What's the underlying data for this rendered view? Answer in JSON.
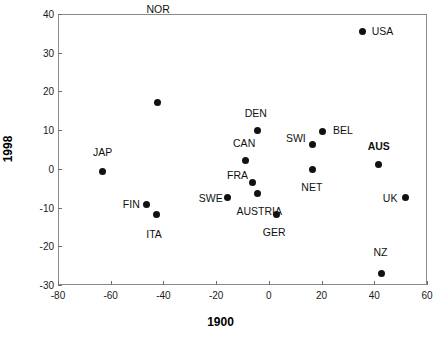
{
  "chart_data": {
    "type": "scatter",
    "title": "",
    "xlabel": "1900",
    "ylabel": "1998",
    "xlim": [
      -80,
      60
    ],
    "ylim": [
      -30,
      40
    ],
    "xticks": [
      -80,
      -60,
      -40,
      -20,
      0,
      20,
      40,
      60
    ],
    "yticks": [
      -30,
      -20,
      -10,
      0,
      10,
      20,
      30,
      40
    ],
    "xtick_labels": [
      "-80",
      "-60",
      "-40",
      "-20",
      "0",
      "20",
      "40",
      "60"
    ],
    "ytick_labels": [
      "-30",
      "-20",
      "-10",
      "0",
      "10",
      "20",
      "30",
      "40"
    ],
    "grid": false,
    "legend": false,
    "marker": "filled-circle",
    "marker_color": "#111111",
    "points": [
      {
        "label": "USA",
        "x": 35.5,
        "y": 35.6,
        "label_dx": 20,
        "label_dy": 0,
        "bold": false
      },
      {
        "label": "NOR",
        "x": -42.4,
        "y": 17.2,
        "label_dx": 1,
        "label_dy": 24,
        "bold": false
      },
      {
        "label": "DEN",
        "x": -4.2,
        "y": 10.0,
        "label_dx": -2,
        "label_dy": 4.4,
        "bold": false
      },
      {
        "label": "BEL",
        "x": 20.5,
        "y": 9.7,
        "label_dx": 20,
        "label_dy": 0.4,
        "bold": false
      },
      {
        "label": "SWI",
        "x": 16.7,
        "y": 6.3,
        "label_dx": -17,
        "label_dy": 1.6,
        "bold": false
      },
      {
        "label": "CAN",
        "x": -9.0,
        "y": 2.1,
        "label_dx": -1,
        "label_dy": 4.6,
        "bold": false
      },
      {
        "label": "AUS",
        "x": 41.7,
        "y": 1.1,
        "label_dx": 0,
        "label_dy": 4.8,
        "bold": true
      },
      {
        "label": "NET",
        "x": 16.7,
        "y": -0.1,
        "label_dx": -1,
        "label_dy": -4.6,
        "bold": false
      },
      {
        "label": "JAP",
        "x": -63.1,
        "y": -0.6,
        "label_dx": 0,
        "label_dy": 5.0,
        "bold": false
      },
      {
        "label": "FRA",
        "x": -6.2,
        "y": -3.6,
        "label_dx": -15,
        "label_dy": 1.9,
        "bold": false
      },
      {
        "label": "AUSTRIA",
        "x": -4.4,
        "y": -6.4,
        "label_dx": 2,
        "label_dy": -4.4,
        "bold": false
      },
      {
        "label": "UK",
        "x": 51.7,
        "y": -7.4,
        "label_dx": -15,
        "label_dy": 0,
        "bold": false
      },
      {
        "label": "SWE",
        "x": -15.6,
        "y": -7.5,
        "label_dx": -17,
        "label_dy": 0,
        "bold": false
      },
      {
        "label": "FIN",
        "x": -46.5,
        "y": -9.2,
        "label_dx": -15,
        "label_dy": 0,
        "bold": false
      },
      {
        "label": "ITA",
        "x": -42.8,
        "y": -11.9,
        "label_dx": -2,
        "label_dy": -5.0,
        "bold": false
      },
      {
        "label": "GER",
        "x": 2.8,
        "y": -11.8,
        "label_dx": -2,
        "label_dy": -4.6,
        "bold": false
      },
      {
        "label": "NZ",
        "x": 42.7,
        "y": -27.0,
        "label_dx": -1,
        "label_dy": 5.6,
        "bold": false
      }
    ]
  }
}
